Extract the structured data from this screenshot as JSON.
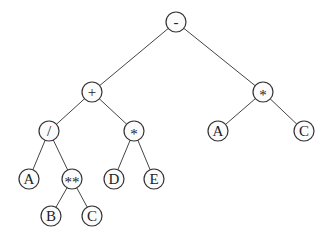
{
  "diagram": {
    "type": "expression-tree",
    "nodes": [
      {
        "id": "n0",
        "label": "-",
        "x": 176,
        "y": 22
      },
      {
        "id": "n1",
        "label": "+",
        "x": 92,
        "y": 92
      },
      {
        "id": "n2",
        "label": "*",
        "x": 263,
        "y": 92
      },
      {
        "id": "n3",
        "label": "/",
        "x": 49,
        "y": 131
      },
      {
        "id": "n4",
        "label": "*",
        "x": 134,
        "y": 131
      },
      {
        "id": "n5",
        "label": "A",
        "x": 218,
        "y": 131
      },
      {
        "id": "n6",
        "label": "C",
        "x": 304,
        "y": 131
      },
      {
        "id": "n7",
        "label": "A",
        "x": 29,
        "y": 179
      },
      {
        "id": "n8",
        "label": "**",
        "x": 72,
        "y": 179
      },
      {
        "id": "n9",
        "label": "D",
        "x": 114,
        "y": 179
      },
      {
        "id": "n10",
        "label": "E",
        "x": 154,
        "y": 179
      },
      {
        "id": "n11",
        "label": "B",
        "x": 51,
        "y": 216
      },
      {
        "id": "n12",
        "label": "C",
        "x": 92,
        "y": 216
      }
    ],
    "edges": [
      [
        "n0",
        "n1"
      ],
      [
        "n0",
        "n2"
      ],
      [
        "n1",
        "n3"
      ],
      [
        "n1",
        "n4"
      ],
      [
        "n2",
        "n5"
      ],
      [
        "n2",
        "n6"
      ],
      [
        "n3",
        "n7"
      ],
      [
        "n3",
        "n8"
      ],
      [
        "n4",
        "n9"
      ],
      [
        "n4",
        "n10"
      ],
      [
        "n8",
        "n11"
      ],
      [
        "n8",
        "n12"
      ]
    ]
  }
}
